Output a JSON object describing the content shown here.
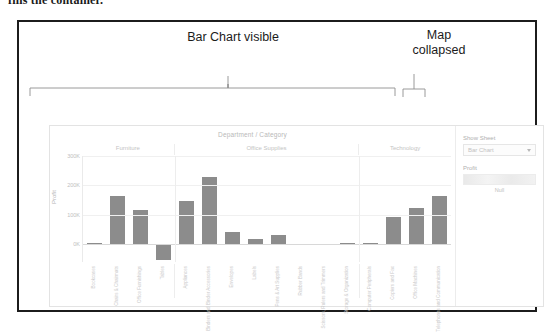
{
  "document": {
    "text_fragment": "fills the container."
  },
  "annotations": {
    "bar_chart_label": "Bar Chart visible",
    "map_label": "Map\ncollapsed"
  },
  "dashboard": {
    "controls": {
      "show_sheet_label": "Show Sheet",
      "sheet_selected": "Bar Chart",
      "sheet_options": [
        "Bar Chart",
        "Map"
      ],
      "profit_legend_label": "Profit",
      "legend_null_label": "Null"
    }
  },
  "chart_data": {
    "type": "bar",
    "title": "Department / Category",
    "xlabel": "Department / Category",
    "ylabel": "Profit",
    "ylim": [
      -60000,
      300000
    ],
    "yticks": [
      300000,
      200000,
      100000,
      0
    ],
    "ytick_labels": [
      "300K",
      "200K",
      "100K",
      "0K"
    ],
    "grid": true,
    "legend_position": "right",
    "groups": [
      {
        "name": "Furniture",
        "categories": [
          "Bookcases",
          "Chairs & Chairmats",
          "Office Furnishings",
          "Tables"
        ],
        "values": [
          4000,
          165000,
          118000,
          -54000
        ]
      },
      {
        "name": "Office Supplies",
        "categories": [
          "Appliances",
          "Binders and Binder Accessories",
          "Envelopes",
          "Labels",
          "Pens & Art Supplies",
          "Rubber Bands",
          "Scissors, Rulers and Trimmers",
          "Storage & Organization"
        ],
        "values": [
          148000,
          230000,
          43000,
          17000,
          31000,
          1500,
          2500,
          3000
        ]
      },
      {
        "name": "Technology",
        "categories": [
          "Computer Peripherals",
          "Copiers and Fax",
          "Office Machines",
          "Telephones and Communication"
        ],
        "values": [
          4000,
          92000,
          122000,
          163000,
          272000
        ]
      }
    ],
    "categories": [
      "Bookcases",
      "Chairs & Chairmats",
      "Office Furnishings",
      "Tables",
      "Appliances",
      "Binders and Binder Accessories",
      "Envelopes",
      "Labels",
      "Pens & Art Supplies",
      "Rubber Bands",
      "Scissors, Rulers and Trimmers",
      "Storage & Organization",
      "Computer Peripherals",
      "Copiers and Fax",
      "Office Machines",
      "Telephones and Communication"
    ],
    "values": [
      4000,
      165000,
      118000,
      -54000,
      148000,
      230000,
      43000,
      17000,
      31000,
      1500,
      2500,
      3000,
      92000,
      122000,
      163000,
      272000
    ],
    "bar_color": "#8c8c8c"
  }
}
